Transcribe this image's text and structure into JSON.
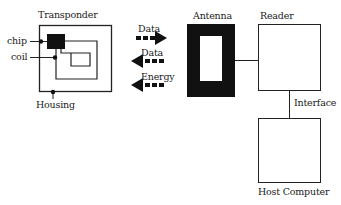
{
  "diagram": {
    "transponder": {
      "title": "Transponder",
      "chip_label": "chip",
      "coil_label": "coil",
      "housing_label": "Housing"
    },
    "arrows": [
      {
        "label": "Data",
        "direction": "right"
      },
      {
        "label": "Data",
        "direction": "left"
      },
      {
        "label": "Energy",
        "direction": "left"
      }
    ],
    "antenna": {
      "label": "Antenna"
    },
    "reader": {
      "label": "Reader"
    },
    "interface": {
      "label": "Interface"
    },
    "host": {
      "label": "Host Computer"
    }
  }
}
